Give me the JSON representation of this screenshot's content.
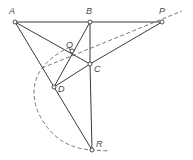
{
  "diagram": {
    "title": "",
    "colors": {
      "line": "#3a3a3a",
      "dashed": "#555555",
      "label": "#4a4a4a",
      "background": "#ffffff"
    },
    "points": [
      {
        "id": "A",
        "label": "A",
        "x": 15,
        "y": 22,
        "lx": 9,
        "ly": 14
      },
      {
        "id": "B",
        "label": "B",
        "x": 90,
        "y": 22,
        "lx": 86,
        "ly": 14
      },
      {
        "id": "P",
        "label": "P",
        "x": 162,
        "y": 22,
        "lx": 159,
        "ly": 14
      },
      {
        "id": "Q",
        "label": "Q",
        "x": 72,
        "y": 51,
        "lx": 66,
        "ly": 48
      },
      {
        "id": "C",
        "label": "C",
        "x": 90,
        "y": 64,
        "lx": 94,
        "ly": 72
      },
      {
        "id": "D",
        "label": "D",
        "x": 54,
        "y": 87,
        "lx": 58,
        "ly": 92
      },
      {
        "id": "R",
        "label": "R",
        "x": 92,
        "y": 150,
        "lx": 96,
        "ly": 147
      }
    ],
    "solid_segments": [
      [
        "A",
        "B"
      ],
      [
        "B",
        "P"
      ],
      [
        "A",
        "C"
      ],
      [
        "A",
        "D"
      ],
      [
        "B",
        "C"
      ],
      [
        "C",
        "R"
      ],
      [
        "B",
        "D"
      ],
      [
        "C",
        "P"
      ],
      [
        "D",
        "C"
      ],
      [
        "D",
        "R"
      ]
    ],
    "dashed_line": {
      "from": [
        42,
        68
      ],
      "to": [
        182,
        11
      ],
      "through": [
        "Q",
        "P"
      ]
    },
    "dashed_arc": {
      "path": "M 70 47 Q 22 70 38 112 Q 55 148 92 150 L 110 151"
    }
  }
}
